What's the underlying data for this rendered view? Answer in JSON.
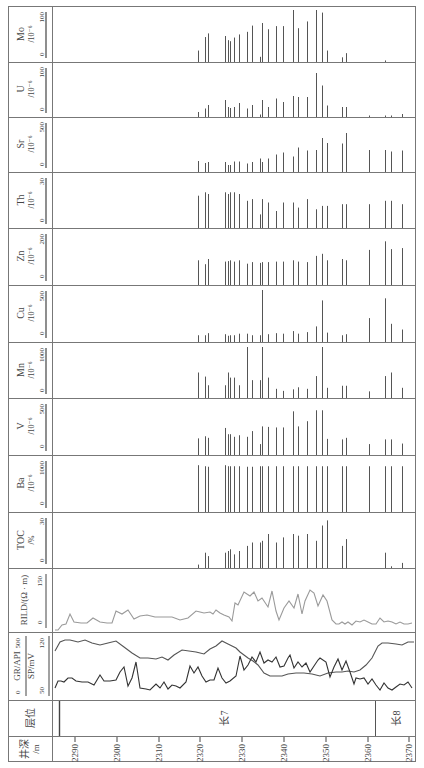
{
  "chart_data": {
    "type": "well-log",
    "orientation": "rotated-90-ccw",
    "depth_axis": {
      "label": "井深/m",
      "ticks": [
        2290,
        2300,
        2310,
        2320,
        2330,
        2340,
        2350,
        2360,
        2370
      ],
      "range": [
        2285,
        2372
      ]
    },
    "strata": [
      {
        "label": "长7",
        "from": 2286,
        "to": 2362
      },
      {
        "label": "长8",
        "from": 2362,
        "to": 2372
      }
    ],
    "sample_depths": [
      2319.5,
      2321.2,
      2321.9,
      2326.0,
      2326.7,
      2327.2,
      2328.2,
      2329.4,
      2331.3,
      2332.5,
      2334.2,
      2334.9,
      2336.3,
      2338.2,
      2339.9,
      2342.1,
      2343.5,
      2345.6,
      2347.8,
      2349.2,
      2350.4,
      2354.0,
      2355.0,
      2360.5,
      2364.3,
      2365.7,
      2368.3
    ],
    "tracks": [
      {
        "key": "Mo",
        "label": "Mo",
        "unit": "/10⁻⁶",
        "min": 0,
        "max": 100,
        "values": [
          22,
          48,
          55,
          50,
          42,
          40,
          47,
          53,
          58,
          70,
          10,
          75,
          63,
          69,
          69,
          100,
          65,
          78,
          100,
          95,
          22,
          9,
          17,
          0,
          3,
          0,
          0
        ]
      },
      {
        "key": "U",
        "label": "U",
        "unit": "/10⁻⁶",
        "min": 0,
        "max": 100,
        "values": [
          10,
          17,
          24,
          34,
          20,
          18,
          20,
          28,
          17,
          24,
          5,
          34,
          20,
          37,
          30,
          42,
          40,
          40,
          88,
          63,
          23,
          20,
          20,
          3,
          3,
          3,
          6
        ]
      },
      {
        "key": "Sr",
        "label": "Sr",
        "unit": "/10⁻⁶",
        "min": 0,
        "max": 500,
        "values": [
          110,
          90,
          100,
          100,
          70,
          70,
          105,
          105,
          85,
          100,
          135,
          100,
          135,
          175,
          195,
          155,
          245,
          215,
          220,
          340,
          290,
          285,
          390,
          220,
          220,
          205,
          215
        ]
      },
      {
        "key": "Th",
        "label": "Th",
        "unit": "/10⁻⁶",
        "min": 0,
        "max": 30,
        "values": [
          19,
          21,
          20,
          21,
          20,
          21,
          21,
          20,
          16,
          17,
          8,
          17,
          15,
          10,
          15,
          15,
          12,
          17,
          11,
          13,
          13,
          14,
          14,
          14,
          16,
          16,
          14
        ]
      },
      {
        "key": "Zn",
        "label": "Zn",
        "unit": "/10⁻⁶",
        "min": 0,
        "max": 200,
        "values": [
          95,
          80,
          100,
          90,
          92,
          95,
          90,
          95,
          82,
          88,
          85,
          88,
          88,
          90,
          90,
          95,
          90,
          88,
          112,
          120,
          95,
          100,
          95,
          135,
          168,
          138,
          142
        ]
      },
      {
        "key": "Cu",
        "label": "Cu",
        "unit": "/10⁻⁶",
        "min": 0,
        "max": 500,
        "values": [
          65,
          65,
          85,
          75,
          60,
          65,
          65,
          80,
          80,
          65,
          65,
          500,
          75,
          85,
          80,
          105,
          80,
          95,
          150,
          400,
          90,
          65,
          75,
          230,
          420,
          175,
          120
        ]
      },
      {
        "key": "Mn",
        "label": "Mn",
        "unit": "/10⁻⁶",
        "min": 0,
        "max": 1000,
        "values": [
          500,
          420,
          250,
          250,
          500,
          400,
          400,
          250,
          1000,
          350,
          350,
          1000,
          400,
          180,
          140,
          170,
          210,
          180,
          430,
          1000,
          200,
          240,
          240,
          130,
          430,
          500,
          200
        ]
      },
      {
        "key": "V",
        "label": "V",
        "unit": "/10⁻⁶",
        "min": 0,
        "max": 500,
        "values": [
          160,
          180,
          165,
          260,
          200,
          200,
          175,
          190,
          175,
          230,
          105,
          275,
          270,
          265,
          265,
          420,
          275,
          325,
          430,
          430,
          155,
          150,
          165,
          105,
          150,
          150,
          110
        ]
      },
      {
        "key": "Ba",
        "label": "Ba",
        "unit": "/10⁻⁶",
        "min": 0,
        "max": 1000,
        "values": [
          900,
          880,
          870,
          900,
          880,
          880,
          880,
          880,
          870,
          870,
          880,
          880,
          880,
          880,
          880,
          880,
          880,
          880,
          880,
          880,
          880,
          880,
          880,
          880,
          880,
          880,
          880
        ]
      },
      {
        "key": "TOC",
        "label": "TOC",
        "unit": "/%",
        "min": 0,
        "max": 30,
        "values": [
          2,
          9,
          7,
          9,
          10,
          11,
          8,
          10,
          13,
          15,
          15,
          16,
          20,
          15,
          18,
          20,
          19,
          20,
          16,
          25,
          28,
          13,
          17,
          0,
          9,
          1,
          3
        ]
      }
    ],
    "curves": [
      {
        "key": "RILD",
        "label": "RILD/(Ω · m)",
        "min": 0,
        "max": 150,
        "color": "#9a9a9a",
        "points": [
          [
            2285.5,
            5
          ],
          [
            2287,
            5
          ],
          [
            2288.5,
            18
          ],
          [
            2290,
            20
          ],
          [
            2291.5,
            45
          ],
          [
            2293,
            22
          ],
          [
            2296,
            20
          ],
          [
            2298,
            20
          ],
          [
            2300,
            32
          ],
          [
            2302.5,
            22
          ],
          [
            2304.5,
            20
          ],
          [
            2306.5,
            20
          ],
          [
            2307.5,
            50
          ],
          [
            2309.5,
            45
          ],
          [
            2311.5,
            53
          ],
          [
            2313.5,
            32
          ],
          [
            2315.5,
            37
          ],
          [
            2317.5,
            40
          ],
          [
            2320,
            38
          ],
          [
            2323,
            38
          ],
          [
            2326,
            38
          ],
          [
            2329,
            25
          ],
          [
            2332.5,
            35
          ],
          [
            2335.5,
            60
          ],
          [
            2337,
            55
          ],
          [
            2339,
            50
          ],
          [
            2340.5,
            55
          ],
          [
            2341.5,
            45
          ],
          [
            2343,
            58
          ],
          [
            2344.5,
            48
          ],
          [
            2346,
            42
          ],
          [
            2348,
            38
          ],
          [
            2350,
            36
          ],
          [
            2350.7,
            100
          ],
          [
            2351.5,
            95
          ],
          [
            2353.5,
            140
          ],
          [
            2356,
            125
          ],
          [
            2357.5,
            135
          ],
          [
            2358.5,
            112
          ],
          [
            2359.5,
            118
          ],
          [
            2361.5,
            98
          ],
          [
            2363.5,
            145
          ],
          [
            2365.5,
            98
          ],
          [
            2367,
            60
          ],
          [
            2368.5,
            118
          ],
          [
            2370.5,
            60
          ],
          [
            2372.5,
            88
          ],
          [
            2374.5,
            100
          ],
          [
            2376.5,
            82
          ],
          [
            2378.5,
            70
          ],
          [
            2380,
            105
          ],
          [
            2382.5,
            100
          ],
          [
            2384.5,
            80
          ],
          [
            2386.5,
            65
          ],
          [
            2388,
            100
          ],
          [
            2390.5,
            30
          ],
          [
            2392,
            10
          ],
          [
            2393.5,
            10
          ],
          [
            2395,
            15
          ],
          [
            2396.5,
            10
          ],
          [
            2398,
            15
          ],
          [
            2399.5,
            5
          ],
          [
            2401,
            15
          ],
          [
            2402.5,
            10
          ],
          [
            2404,
            15
          ],
          [
            2405.5,
            10
          ],
          [
            2407.5,
            8
          ],
          [
            2409,
            10
          ]
        ]
      },
      {
        "key": "GR",
        "label": "GR/API",
        "min": 0,
        "max": 500,
        "color": "#444444",
        "note": "upper curve, high GR through 长7 lower/upper parts, drops to ~200 in middle"
      },
      {
        "key": "SP",
        "label": "SP/mV",
        "min": 50,
        "max": 120,
        "color": "#333333",
        "note": "lower serrated curve"
      }
    ],
    "header_scales": {
      "Mo": [
        "0",
        "100"
      ],
      "U": [
        "0",
        "100"
      ],
      "Sr": [
        "0",
        "500"
      ],
      "Th": [
        "0",
        "30"
      ],
      "Zn": [
        "0",
        "200"
      ],
      "Cu": [
        "0",
        "500"
      ],
      "Mn": [
        "0",
        "1000"
      ],
      "V": [
        "0",
        "500"
      ],
      "Ba": [
        "0",
        "1000"
      ],
      "TOC": [
        "0",
        "30"
      ],
      "RILD": [
        "0",
        "150"
      ],
      "GR": [
        "0",
        "500"
      ],
      "SP": [
        "50",
        "120"
      ]
    }
  },
  "labels": {
    "mo": {
      "name": "Mo",
      "unit": "/10⁻⁶",
      "min": "0",
      "max": "100"
    },
    "u": {
      "name": "U",
      "unit": "/10⁻⁶",
      "min": "0",
      "max": "100"
    },
    "sr": {
      "name": "Sr",
      "unit": "/10⁻⁶",
      "min": "0",
      "max": "500"
    },
    "th": {
      "name": "Th",
      "unit": "/10⁻⁶",
      "min": "0",
      "max": "30"
    },
    "zn": {
      "name": "Zn",
      "unit": "/10⁻⁶",
      "min": "0",
      "max": "200"
    },
    "cu": {
      "name": "Cu",
      "unit": "/10⁻⁶",
      "min": "0",
      "max": "500"
    },
    "mn": {
      "name": "Mn",
      "unit": "/10⁻⁶",
      "min": "0",
      "max": "1000"
    },
    "v": {
      "name": "V",
      "unit": "/10⁻⁶",
      "min": "0",
      "max": "500"
    },
    "ba": {
      "name": "Ba",
      "unit": "/10⁻⁶",
      "min": "0",
      "max": "1000"
    },
    "toc": {
      "name": "TOC",
      "unit": "/%",
      "min": "0",
      "max": "30"
    },
    "rild": {
      "name": "RILD/(Ω · m)",
      "min": "0",
      "max": "150"
    },
    "gr": {
      "name": "GR/API",
      "min": "0",
      "max": "500"
    },
    "sp": {
      "name": "SP/mV",
      "min": "50",
      "max": "120"
    },
    "layer": {
      "name": "层位",
      "c7": "长7",
      "c8": "长8"
    },
    "depth": {
      "name": "井深",
      "unit": "/m",
      "t2290": "2290",
      "t2300": "2300",
      "t2310": "2310",
      "t2320": "2320",
      "t2330": "2330",
      "t2340": "2340",
      "t2350": "2350",
      "t2360": "2360",
      "t2370": "2370"
    }
  }
}
